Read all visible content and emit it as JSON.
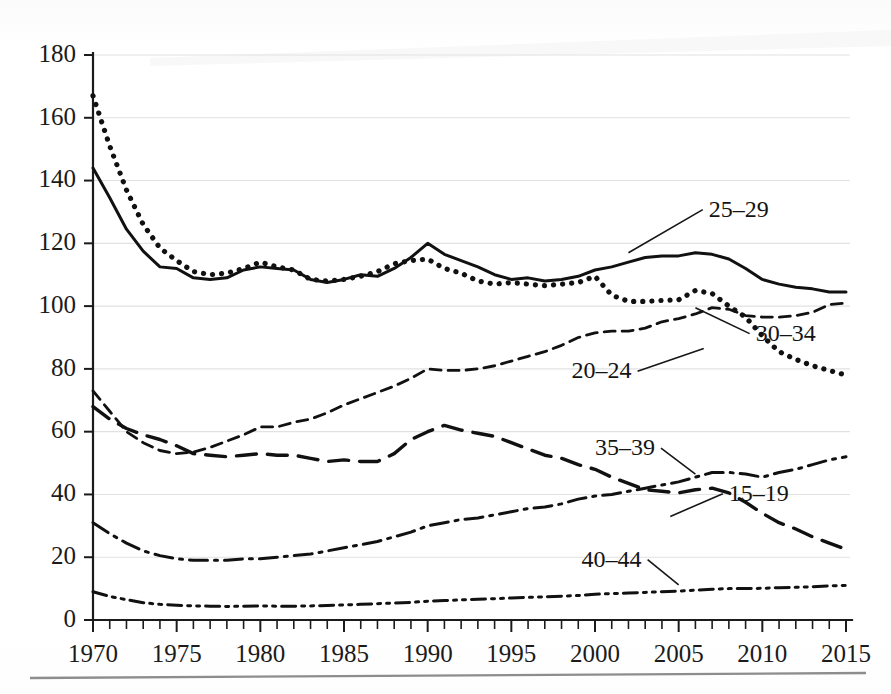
{
  "figure": {
    "name": "age-specific-rate-line-chart",
    "background": "#ffffff",
    "ink_color": "#111111",
    "grid_color": "#e2e2e2"
  },
  "axes": {
    "y": {
      "label": "",
      "min": 0,
      "max": 180,
      "step": 20,
      "ticks": [
        "0",
        "20",
        "40",
        "60",
        "80",
        "100",
        "120",
        "140",
        "160",
        "180"
      ]
    },
    "x": {
      "label": "",
      "min": 1970,
      "max": 2015,
      "major_step": 5,
      "minor_step": 1,
      "ticks": [
        "1970",
        "1975",
        "1980",
        "1985",
        "1990",
        "1995",
        "2000",
        "2005",
        "2010",
        "2015"
      ]
    }
  },
  "annotations": [
    {
      "text": "25–29",
      "x": 2006.8,
      "y": 128.5,
      "anchor": "start",
      "leader_to_x": 2002.0,
      "leader_to_y": 117.0
    },
    {
      "text": "30–34",
      "x": 2009.6,
      "y": 89.0,
      "anchor": "start",
      "leader_to_x": 2006.0,
      "leader_to_y": 99.5
    },
    {
      "text": "20–24",
      "x": 1998.6,
      "y": 77.0,
      "anchor": "start",
      "leader_to_x": 2006.5,
      "leader_to_y": 86.5
    },
    {
      "text": "35–39",
      "x": 2000.0,
      "y": 52.5,
      "anchor": "start",
      "leader_to_x": 2006.0,
      "leader_to_y": 46.5
    },
    {
      "text": "15–19",
      "x": 2008.0,
      "y": 38.0,
      "anchor": "start",
      "leader_to_x": 2004.5,
      "leader_to_y": 33.0
    },
    {
      "text": "40–44",
      "x": 1999.2,
      "y": 17.0,
      "anchor": "start",
      "leader_to_x": 2005.0,
      "leader_to_y": 11.2
    }
  ],
  "chart_data": {
    "type": "line",
    "title": "",
    "subtitle": "",
    "xlabel": "",
    "ylabel": "",
    "xlim": [
      1970,
      2015
    ],
    "ylim": [
      0,
      180
    ],
    "grid": true,
    "legend": "inline-labels",
    "x": [
      1970,
      1971,
      1972,
      1973,
      1974,
      1975,
      1976,
      1977,
      1978,
      1979,
      1980,
      1981,
      1982,
      1983,
      1984,
      1985,
      1986,
      1987,
      1988,
      1989,
      1990,
      1991,
      1992,
      1993,
      1994,
      1995,
      1996,
      1997,
      1998,
      1999,
      2000,
      2001,
      2002,
      2003,
      2004,
      2005,
      2006,
      2007,
      2008,
      2009,
      2010,
      2011,
      2012,
      2013,
      2014,
      2015
    ],
    "series": [
      {
        "name": "20–24",
        "dash": "dotted",
        "values": [
          167.0,
          151.0,
          137.0,
          126.0,
          118.5,
          114.5,
          111.0,
          110.0,
          110.5,
          112.0,
          114.0,
          112.5,
          111.5,
          108.5,
          108.0,
          108.5,
          109.5,
          111.0,
          113.5,
          114.5,
          115.0,
          112.0,
          110.5,
          108.0,
          107.0,
          107.5,
          107.0,
          106.5,
          107.0,
          107.5,
          109.5,
          103.5,
          101.5,
          101.5,
          101.8,
          102.0,
          105.0,
          104.0,
          100.0,
          96.5,
          90.5,
          85.5,
          83.0,
          81.0,
          79.5,
          78.0
        ]
      },
      {
        "name": "25–29",
        "dash": "solid",
        "values": [
          144.0,
          134.5,
          124.5,
          117.5,
          112.5,
          112.0,
          109.0,
          108.5,
          109.0,
          111.5,
          112.5,
          112.0,
          111.5,
          108.5,
          107.5,
          108.5,
          110.0,
          109.5,
          112.0,
          115.5,
          120.0,
          116.5,
          114.5,
          112.5,
          110.0,
          108.5,
          109.0,
          108.0,
          108.5,
          109.5,
          111.5,
          112.5,
          114.0,
          115.5,
          116.0,
          116.0,
          117.0,
          116.5,
          115.0,
          112.0,
          108.5,
          107.0,
          106.0,
          105.5,
          104.5,
          104.5
        ]
      },
      {
        "name": "30–34",
        "dash": "short-dash",
        "values": [
          73.0,
          66.5,
          60.0,
          56.5,
          54.0,
          53.0,
          53.5,
          55.0,
          57.0,
          59.0,
          61.5,
          61.5,
          63.0,
          64.0,
          66.0,
          68.5,
          70.5,
          72.5,
          74.5,
          77.0,
          80.0,
          79.5,
          79.5,
          80.0,
          81.0,
          82.5,
          84.0,
          85.5,
          87.5,
          90.0,
          91.5,
          92.0,
          92.0,
          93.0,
          95.0,
          96.0,
          97.5,
          99.5,
          99.0,
          97.0,
          96.5,
          96.5,
          97.0,
          98.0,
          100.5,
          101.0
        ]
      },
      {
        "name": "15–19",
        "dash": "long-dash",
        "values": [
          68.0,
          64.0,
          61.0,
          59.0,
          57.5,
          55.5,
          53.0,
          52.5,
          52.0,
          52.5,
          53.0,
          52.5,
          52.5,
          51.5,
          50.5,
          51.0,
          50.5,
          50.5,
          53.0,
          57.5,
          60.0,
          62.0,
          60.5,
          59.5,
          58.5,
          56.5,
          54.5,
          52.5,
          51.5,
          49.5,
          48.0,
          45.5,
          43.5,
          41.5,
          41.0,
          40.5,
          41.5,
          42.0,
          40.5,
          37.5,
          34.0,
          31.0,
          29.0,
          26.5,
          24.5,
          22.5
        ]
      },
      {
        "name": "35–39",
        "dash": "dash-dot",
        "values": [
          31.0,
          27.5,
          24.5,
          22.0,
          20.5,
          19.5,
          19.0,
          19.0,
          19.0,
          19.5,
          19.5,
          20.0,
          20.5,
          21.0,
          22.0,
          23.0,
          24.0,
          25.0,
          26.5,
          28.0,
          30.0,
          31.0,
          32.0,
          32.5,
          33.5,
          34.5,
          35.5,
          36.0,
          37.0,
          38.5,
          39.5,
          40.0,
          41.0,
          42.0,
          43.0,
          44.0,
          45.5,
          47.0,
          47.0,
          46.5,
          45.5,
          47.0,
          48.0,
          49.5,
          51.0,
          52.0
        ]
      },
      {
        "name": "40–44",
        "dash": "dash-dot-dot",
        "values": [
          9.0,
          7.5,
          6.5,
          5.5,
          5.0,
          4.7,
          4.5,
          4.4,
          4.3,
          4.4,
          4.5,
          4.4,
          4.4,
          4.5,
          4.6,
          4.8,
          5.0,
          5.2,
          5.4,
          5.6,
          6.0,
          6.2,
          6.4,
          6.6,
          6.8,
          7.0,
          7.2,
          7.4,
          7.6,
          7.8,
          8.2,
          8.4,
          8.6,
          8.8,
          9.0,
          9.2,
          9.5,
          9.8,
          10.0,
          10.0,
          10.1,
          10.3,
          10.4,
          10.6,
          10.9,
          11.0
        ]
      }
    ]
  }
}
